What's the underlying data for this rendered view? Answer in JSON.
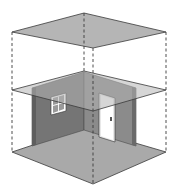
{
  "diagram": {
    "title": "Isometric room with horizontal section planes",
    "colors": {
      "background": "#ffffff",
      "plane_fill": "#b5b5b5",
      "plane_stroke": "#3a3a3a",
      "wall_left": "#767676",
      "wall_right": "#8a8a8a",
      "wall_edge": "#555555",
      "floor": "#a8a8a8",
      "dashed_line": "#3a3a3a",
      "door": "#ffffff",
      "window_frame": "#ffffff",
      "window_glass": "#9a9a9a"
    },
    "elements": {
      "top_plane": "upper horizontal plane",
      "middle_plane": "cutting plane",
      "floor_plane": "floor",
      "left_wall": "wall with window",
      "right_wall": "wall with door",
      "window": "window",
      "door": "door",
      "vertical_guides": "dashed vertical projection lines"
    }
  }
}
